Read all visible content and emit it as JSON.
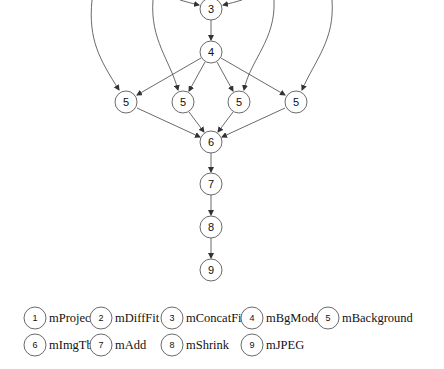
{
  "diagram": {
    "type": "workflow-dag",
    "nodes": [
      {
        "id": "n3",
        "label": "3",
        "x": 211,
        "y": 9
      },
      {
        "id": "n4",
        "label": "4",
        "x": 211,
        "y": 52
      },
      {
        "id": "n5a",
        "label": "5",
        "x": 126,
        "y": 102
      },
      {
        "id": "n5b",
        "label": "5",
        "x": 183,
        "y": 102
      },
      {
        "id": "n5c",
        "label": "5",
        "x": 239,
        "y": 102
      },
      {
        "id": "n5d",
        "label": "5",
        "x": 296,
        "y": 102
      },
      {
        "id": "n6",
        "label": "6",
        "x": 211,
        "y": 142
      },
      {
        "id": "n7",
        "label": "7",
        "x": 211,
        "y": 184
      },
      {
        "id": "n8",
        "label": "8",
        "x": 211,
        "y": 227
      },
      {
        "id": "n9",
        "label": "9",
        "x": 211,
        "y": 270
      }
    ],
    "edges": [
      {
        "from": "n3",
        "to": "n4"
      },
      {
        "from": "n4",
        "to": "n5a"
      },
      {
        "from": "n4",
        "to": "n5b"
      },
      {
        "from": "n4",
        "to": "n5c"
      },
      {
        "from": "n4",
        "to": "n5d"
      },
      {
        "from": "n5a",
        "to": "n6"
      },
      {
        "from": "n5b",
        "to": "n6"
      },
      {
        "from": "n5c",
        "to": "n6"
      },
      {
        "from": "n5d",
        "to": "n6"
      },
      {
        "from": "n6",
        "to": "n7"
      },
      {
        "from": "n7",
        "to": "n8"
      },
      {
        "from": "n8",
        "to": "n9"
      }
    ],
    "legend": [
      {
        "num": "1",
        "name": "mProjectPP"
      },
      {
        "num": "2",
        "name": "mDiffFit"
      },
      {
        "num": "3",
        "name": "mConcatFit"
      },
      {
        "num": "4",
        "name": "mBgModel"
      },
      {
        "num": "5",
        "name": "mBackground"
      },
      {
        "num": "6",
        "name": "mImgTbl"
      },
      {
        "num": "7",
        "name": "mAdd"
      },
      {
        "num": "8",
        "name": "mShrink"
      },
      {
        "num": "9",
        "name": "mJPEG"
      }
    ],
    "colors": {
      "stroke": "#333333",
      "text": "#111111",
      "background": "#ffffff"
    }
  }
}
